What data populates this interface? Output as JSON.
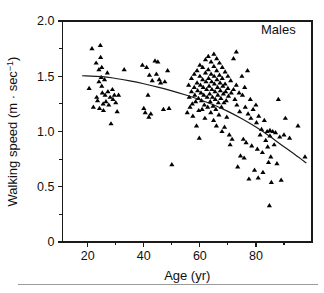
{
  "figure": {
    "background": "#ffffff",
    "frame_color": "#1a1a1a",
    "marker_color": "#000000",
    "curve_color": "#1a1a1a",
    "rule_color": "#9a9a9a"
  },
  "axes": {
    "x_title": "Age (yr)",
    "y_title_main": "Walking speed (m · sec",
    "y_title_sup": "−1",
    "y_title_close": ")",
    "x_ticks_major": [
      "20",
      "40",
      "60",
      "80"
    ],
    "x_ticks_major_values": [
      20,
      40,
      60,
      80
    ],
    "x_ticks_minor_values": [
      10,
      30,
      50,
      70,
      90
    ],
    "y_ticks_major": [
      "0",
      "0.5",
      "1.0",
      "1.5",
      "2.0"
    ],
    "y_ticks_major_values": [
      0,
      0.5,
      1.0,
      1.5,
      2.0
    ],
    "y_ticks_minor_values": [
      0.25,
      0.75,
      1.25,
      1.75
    ],
    "xlim": [
      11,
      100
    ],
    "ylim": [
      0,
      2.0
    ]
  },
  "annotations": [
    {
      "text": "Males",
      "x": 88,
      "y": 1.88
    }
  ],
  "chart_data": {
    "type": "scatter",
    "title": "",
    "xlabel": "Age (yr)",
    "ylabel": "Walking speed (m · sec−1)",
    "xlim": [
      11,
      100
    ],
    "ylim": [
      0,
      2.0
    ],
    "grid": false,
    "legend": "none",
    "marker": "triangle-up-filled",
    "series": [
      {
        "name": "Males",
        "points": [
          [
            20.5,
            1.39
          ],
          [
            21.5,
            1.75
          ],
          [
            22.0,
            1.22
          ],
          [
            23.0,
            1.62
          ],
          [
            23.2,
            1.31
          ],
          [
            23.5,
            1.28
          ],
          [
            24.0,
            1.56
          ],
          [
            24.0,
            1.45
          ],
          [
            24.2,
            1.21
          ],
          [
            24.5,
            1.78
          ],
          [
            24.6,
            1.67
          ],
          [
            24.8,
            1.49
          ],
          [
            25.0,
            1.58
          ],
          [
            25.0,
            1.41
          ],
          [
            25.2,
            1.35
          ],
          [
            25.5,
            1.25
          ],
          [
            25.6,
            1.19
          ],
          [
            26.0,
            1.47
          ],
          [
            26.2,
            1.33
          ],
          [
            26.5,
            1.27
          ],
          [
            27.0,
            1.53
          ],
          [
            27.2,
            1.36
          ],
          [
            27.5,
            1.24
          ],
          [
            28.0,
            1.31
          ],
          [
            28.3,
            1.07
          ],
          [
            28.8,
            1.38
          ],
          [
            29.0,
            1.29
          ],
          [
            29.5,
            1.33
          ],
          [
            30.0,
            1.26
          ],
          [
            30.5,
            1.18
          ],
          [
            31.0,
            1.33
          ],
          [
            33.0,
            1.56
          ],
          [
            39.5,
            1.6
          ],
          [
            40.0,
            1.21
          ],
          [
            40.5,
            1.17
          ],
          [
            41.0,
            1.58
          ],
          [
            41.5,
            1.33
          ],
          [
            41.8,
            1.13
          ],
          [
            42.0,
            1.51
          ],
          [
            42.5,
            1.16
          ],
          [
            43.0,
            1.46
          ],
          [
            44.0,
            1.64
          ],
          [
            44.5,
            1.52
          ],
          [
            45.0,
            1.63
          ],
          [
            45.5,
            1.47
          ],
          [
            46.0,
            1.44
          ],
          [
            47.0,
            1.2
          ],
          [
            47.5,
            1.45
          ],
          [
            48.5,
            1.55
          ],
          [
            49.0,
            1.21
          ],
          [
            50.0,
            0.7
          ],
          [
            55.5,
            1.17
          ],
          [
            56.0,
            1.42
          ],
          [
            56.2,
            1.31
          ],
          [
            56.5,
            1.22
          ],
          [
            57.0,
            1.48
          ],
          [
            57.0,
            1.36
          ],
          [
            57.3,
            1.25
          ],
          [
            57.5,
            1.14
          ],
          [
            58.0,
            1.52
          ],
          [
            58.0,
            1.4
          ],
          [
            58.2,
            1.33
          ],
          [
            58.5,
            1.27
          ],
          [
            58.8,
            1.05
          ],
          [
            59.0,
            1.55
          ],
          [
            59.0,
            1.44
          ],
          [
            59.2,
            1.37
          ],
          [
            59.5,
            1.3
          ],
          [
            59.6,
            1.19
          ],
          [
            59.8,
            0.94
          ],
          [
            60.0,
            1.6
          ],
          [
            60.0,
            1.5
          ],
          [
            60.2,
            1.42
          ],
          [
            60.4,
            1.35
          ],
          [
            60.6,
            1.28
          ],
          [
            60.8,
            1.2
          ],
          [
            61.0,
            1.58
          ],
          [
            61.0,
            1.47
          ],
          [
            61.2,
            1.4
          ],
          [
            61.4,
            1.33
          ],
          [
            61.6,
            1.24
          ],
          [
            61.8,
            1.12
          ],
          [
            62.0,
            1.65
          ],
          [
            62.0,
            1.53
          ],
          [
            62.2,
            1.45
          ],
          [
            62.4,
            1.38
          ],
          [
            62.6,
            1.31
          ],
          [
            62.8,
            1.22
          ],
          [
            63.0,
            1.68
          ],
          [
            63.0,
            1.56
          ],
          [
            63.1,
            1.48
          ],
          [
            63.3,
            1.41
          ],
          [
            63.5,
            1.34
          ],
          [
            63.7,
            1.27
          ],
          [
            63.9,
            1.17
          ],
          [
            64.0,
            1.63
          ],
          [
            64.0,
            1.52
          ],
          [
            64.2,
            1.45
          ],
          [
            64.3,
            1.38
          ],
          [
            64.5,
            1.31
          ],
          [
            64.7,
            1.23
          ],
          [
            64.9,
            1.1
          ],
          [
            65.0,
            1.7
          ],
          [
            65.0,
            1.59
          ],
          [
            65.1,
            1.5
          ],
          [
            65.2,
            1.43
          ],
          [
            65.4,
            1.36
          ],
          [
            65.5,
            1.29
          ],
          [
            65.7,
            1.2
          ],
          [
            65.9,
            1.05
          ],
          [
            66.0,
            1.66
          ],
          [
            66.0,
            1.55
          ],
          [
            66.1,
            1.47
          ],
          [
            66.3,
            1.4
          ],
          [
            66.4,
            1.33
          ],
          [
            66.6,
            1.26
          ],
          [
            66.8,
            1.15
          ],
          [
            67.0,
            1.62
          ],
          [
            67.0,
            1.51
          ],
          [
            67.2,
            1.44
          ],
          [
            67.3,
            1.37
          ],
          [
            67.5,
            1.3
          ],
          [
            67.7,
            1.22
          ],
          [
            67.9,
            1.0
          ],
          [
            68.0,
            1.58
          ],
          [
            68.0,
            1.48
          ],
          [
            68.2,
            1.41
          ],
          [
            68.4,
            1.34
          ],
          [
            68.6,
            1.26
          ],
          [
            68.8,
            1.04
          ],
          [
            69.0,
            1.54
          ],
          [
            69.0,
            1.43
          ],
          [
            69.2,
            1.36
          ],
          [
            69.4,
            1.28
          ],
          [
            69.6,
            1.13
          ],
          [
            70.0,
            1.5
          ],
          [
            70.0,
            1.39
          ],
          [
            70.2,
            1.32
          ],
          [
            70.5,
            0.97
          ],
          [
            70.8,
            0.88
          ],
          [
            71.0,
            1.46
          ],
          [
            71.2,
            1.35
          ],
          [
            71.5,
            0.93
          ],
          [
            72.0,
            1.66
          ],
          [
            72.0,
            1.38
          ],
          [
            72.5,
            1.29
          ],
          [
            73.0,
            1.72
          ],
          [
            73.0,
            1.42
          ],
          [
            73.2,
            1.24
          ],
          [
            73.5,
            0.68
          ],
          [
            74.0,
            1.35
          ],
          [
            74.2,
            1.18
          ],
          [
            74.5,
            0.78
          ],
          [
            75.0,
            1.5
          ],
          [
            75.2,
            1.33
          ],
          [
            75.5,
            0.93
          ],
          [
            75.8,
            0.76
          ],
          [
            76.0,
            1.4
          ],
          [
            76.2,
            1.22
          ],
          [
            76.5,
            0.9
          ],
          [
            77.0,
            1.55
          ],
          [
            77.2,
            1.16
          ],
          [
            77.5,
            0.57
          ],
          [
            78.0,
            1.29
          ],
          [
            78.2,
            1.12
          ],
          [
            78.5,
            0.87
          ],
          [
            79.0,
            1.2
          ],
          [
            79.5,
            0.65
          ],
          [
            80.0,
            1.24
          ],
          [
            80.2,
            1.08
          ],
          [
            80.5,
            0.84
          ],
          [
            80.8,
            0.58
          ],
          [
            81.0,
            1.14
          ],
          [
            81.5,
            0.97
          ],
          [
            82.0,
            1.02
          ],
          [
            82.3,
            0.81
          ],
          [
            82.5,
            0.63
          ],
          [
            83.0,
            1.1
          ],
          [
            83.5,
            0.92
          ],
          [
            84.0,
            1.0
          ],
          [
            84.2,
            0.86
          ],
          [
            84.5,
            0.72
          ],
          [
            84.8,
            0.33
          ],
          [
            85.0,
            1.01
          ],
          [
            85.0,
            0.96
          ],
          [
            85.3,
            0.77
          ],
          [
            85.5,
            0.54
          ],
          [
            86.0,
            1.0
          ],
          [
            86.5,
            0.88
          ],
          [
            87.0,
            0.99
          ],
          [
            87.5,
            0.71
          ],
          [
            88.0,
            1.29
          ],
          [
            88.5,
            0.95
          ],
          [
            89.0,
            0.56
          ],
          [
            90.0,
            0.97
          ],
          [
            90.5,
            1.12
          ],
          [
            92.0,
            0.94
          ],
          [
            95.0,
            1.05
          ],
          [
            97.5,
            0.77
          ]
        ]
      }
    ],
    "fit_curve": {
      "name": "quadratic regression fit",
      "points": [
        [
          18.0,
          1.505
        ],
        [
          25.0,
          1.497
        ],
        [
          30.0,
          1.48
        ],
        [
          35.0,
          1.458
        ],
        [
          40.0,
          1.432
        ],
        [
          45.0,
          1.402
        ],
        [
          50.0,
          1.368
        ],
        [
          55.0,
          1.33
        ],
        [
          60.0,
          1.288
        ],
        [
          65.0,
          1.24
        ],
        [
          70.0,
          1.182
        ],
        [
          75.0,
          1.115
        ],
        [
          80.0,
          1.04
        ],
        [
          85.0,
          0.955
        ],
        [
          90.0,
          0.862
        ],
        [
          94.0,
          0.79
        ],
        [
          98.0,
          0.715
        ]
      ]
    }
  }
}
